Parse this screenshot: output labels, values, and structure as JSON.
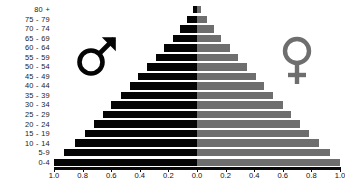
{
  "chart_data": {
    "type": "bar",
    "title": "",
    "subtitle": "",
    "xlabel": "",
    "ylabel": "",
    "orientation": "horizontal",
    "layout": "population-pyramid",
    "grid": false,
    "legend_position": "inside-plot",
    "categories": [
      "80 +",
      "75 - 79",
      "70 - 74",
      "65 - 69",
      "60 - 64",
      "55 - 59",
      "50 - 54",
      "45 - 49",
      "40 - 44",
      "35 - 39",
      "30 - 34",
      "25 - 29",
      "20 - 24",
      "15 - 19",
      "10 - 14",
      "5-9",
      "0-4"
    ],
    "series": [
      {
        "name": "Male",
        "side": "left",
        "color": "#050505",
        "values": [
          0.03,
          0.07,
          0.12,
          0.17,
          0.23,
          0.29,
          0.35,
          0.41,
          0.47,
          0.53,
          0.6,
          0.66,
          0.72,
          0.78,
          0.85,
          0.93,
          1.0
        ]
      },
      {
        "name": "Female",
        "side": "right",
        "color": "#6e6e6e",
        "values": [
          0.03,
          0.07,
          0.12,
          0.17,
          0.23,
          0.29,
          0.35,
          0.41,
          0.47,
          0.53,
          0.6,
          0.66,
          0.72,
          0.78,
          0.85,
          0.93,
          1.0
        ]
      }
    ],
    "xlim_left": [
      1.0,
      0.0
    ],
    "xlim_right": [
      0.0,
      1.0
    ],
    "xticks_left": [
      "1.0",
      "0.8",
      "0.6",
      "0.4",
      "0.2"
    ],
    "xticks_right": [
      "0.0",
      "0.2",
      "0.4",
      "0.6",
      "0.8",
      "1.0"
    ],
    "xtick_values_left": [
      1.0,
      0.8,
      0.6,
      0.4,
      0.2
    ],
    "xtick_values_right": [
      0.0,
      0.2,
      0.4,
      0.6,
      0.8,
      1.0
    ],
    "annotations": [
      {
        "name": "male-symbol",
        "glyph": "mars",
        "side": "left"
      },
      {
        "name": "female-symbol",
        "glyph": "venus",
        "side": "right"
      }
    ]
  },
  "colors": {
    "male": "#050505",
    "female": "#6e6e6e",
    "axis": "#0a0a0a",
    "text": "#1a1a1a",
    "background": "#ffffff"
  }
}
